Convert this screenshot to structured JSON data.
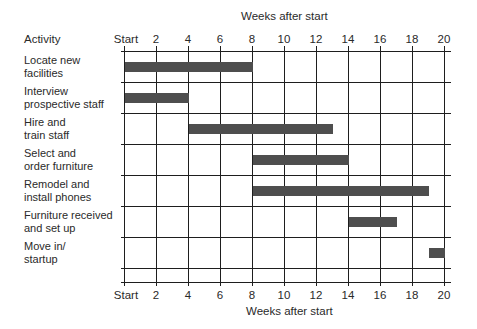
{
  "chart_data": {
    "type": "gantt",
    "title": "Weeks after start",
    "xlabel": "Weeks after start",
    "ylabel": "Activity",
    "x_ticks": [
      "Start",
      "2",
      "4",
      "6",
      "8",
      "10",
      "12",
      "14",
      "16",
      "18",
      "20"
    ],
    "xlim": [
      0,
      20
    ],
    "grid": true,
    "tasks": [
      {
        "label": "Locate new facilities",
        "line1": "Locate new",
        "line2": "facilities",
        "start": 0,
        "end": 8
      },
      {
        "label": "Interview prospective staff",
        "line1": "Interview",
        "line2": "prospective staff",
        "start": 0,
        "end": 4
      },
      {
        "label": "Hire and train staff",
        "line1": "Hire and",
        "line2": "train staff",
        "start": 4,
        "end": 13
      },
      {
        "label": "Select and order furniture",
        "line1": "Select and",
        "line2": "order furniture",
        "start": 8,
        "end": 14
      },
      {
        "label": "Remodel and install phones",
        "line1": "Remodel and",
        "line2": "install phones",
        "start": 8,
        "end": 19
      },
      {
        "label": "Furniture received and set up",
        "line1": "Furniture received",
        "line2": "and set up",
        "start": 14,
        "end": 17
      },
      {
        "label": "Move in/ startup",
        "line1": "Move in/",
        "line2": "startup",
        "start": 19,
        "end": 20
      }
    ],
    "bar_color": "#4e4e4e",
    "grid_color": "#1e1e1e"
  },
  "header": {
    "top_axis_title": "Weeks after start",
    "activity_header": "Activity"
  },
  "footer": {
    "bottom_axis_title": "Weeks after start"
  }
}
